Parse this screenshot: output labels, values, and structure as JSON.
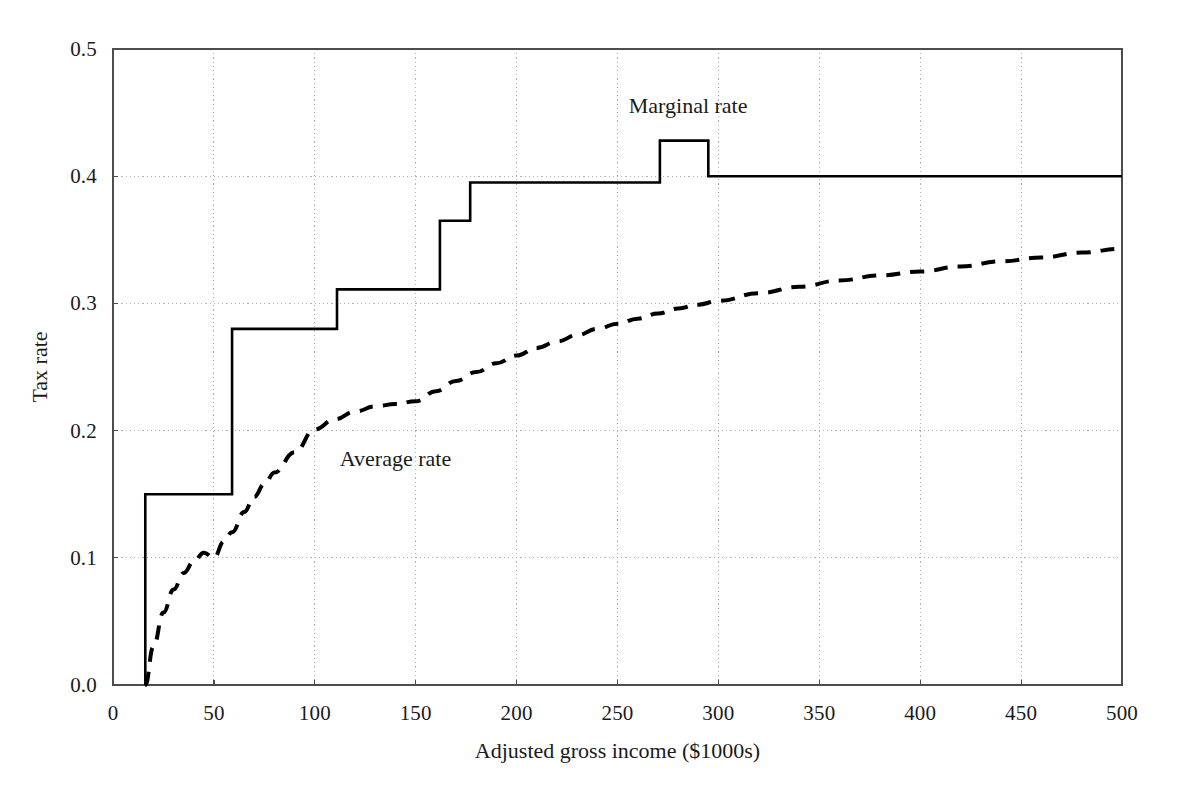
{
  "chart_data": {
    "type": "line",
    "title": "",
    "xlabel": "Adjusted gross income ($1000s)",
    "ylabel": "Tax rate",
    "xlim": [
      0,
      500
    ],
    "ylim": [
      0.0,
      0.5
    ],
    "xticks": [
      "0",
      "50",
      "100",
      "150",
      "200",
      "250",
      "300",
      "350",
      "400",
      "450",
      "500"
    ],
    "xtick_values": [
      0,
      50,
      100,
      150,
      200,
      250,
      300,
      350,
      400,
      450,
      500
    ],
    "yticks": [
      "0.0",
      "0.1",
      "0.2",
      "0.3",
      "0.4",
      "0.5"
    ],
    "ytick_values": [
      0.0,
      0.1,
      0.2,
      0.3,
      0.4,
      0.5
    ],
    "grid": true,
    "grid_style": "dotted",
    "legend_position": "inline-annotation",
    "series": [
      {
        "name": "Marginal rate",
        "style": "solid",
        "color": "#000000",
        "shape": "step",
        "annotation": "Marginal rate",
        "annotation_x": 285,
        "annotation_y": 0.455,
        "breakpoints_x": [
          16,
          16,
          59,
          59,
          111,
          111,
          162,
          162,
          177,
          177,
          271,
          271,
          295,
          295,
          500
        ],
        "breakpoints_y": [
          0.0,
          0.15,
          0.15,
          0.28,
          0.28,
          0.311,
          0.311,
          0.365,
          0.365,
          0.395,
          0.395,
          0.428,
          0.428,
          0.4,
          0.4
        ],
        "rate_levels": [
          0.0,
          0.15,
          0.28,
          0.311,
          0.365,
          0.395,
          0.428,
          0.4
        ]
      },
      {
        "name": "Average rate",
        "style": "dashed",
        "color": "#000000",
        "shape": "smooth",
        "annotation": "Average rate",
        "annotation_x": 140,
        "annotation_y": 0.178,
        "x": [
          16,
          20,
          25,
          30,
          35,
          40,
          45,
          50,
          55,
          59,
          65,
          70,
          75,
          80,
          90,
          100,
          110,
          120,
          130,
          140,
          150,
          160,
          170,
          180,
          190,
          200,
          210,
          220,
          230,
          240,
          250,
          260,
          270,
          280,
          290,
          300,
          320,
          340,
          360,
          380,
          400,
          420,
          440,
          460,
          480,
          500
        ],
        "y": [
          0.0,
          0.03,
          0.057,
          0.075,
          0.088,
          0.097,
          0.104,
          0.1,
          0.113,
          0.12,
          0.136,
          0.148,
          0.158,
          0.167,
          0.183,
          0.201,
          0.209,
          0.215,
          0.219,
          0.221,
          0.223,
          0.231,
          0.239,
          0.246,
          0.253,
          0.259,
          0.265,
          0.27,
          0.275,
          0.28,
          0.284,
          0.288,
          0.292,
          0.296,
          0.299,
          0.302,
          0.308,
          0.313,
          0.318,
          0.322,
          0.325,
          0.329,
          0.333,
          0.336,
          0.34,
          0.343
        ]
      }
    ]
  },
  "axes": {
    "y_title": "Tax rate",
    "x_title": "Adjusted gross income ($1000s)"
  },
  "colors": {
    "line": "#1a1a1a",
    "grid": "#b4b4b4",
    "axis": "#4d4d4d",
    "background": "#ffffff"
  }
}
